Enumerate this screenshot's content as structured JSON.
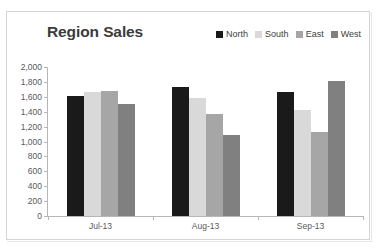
{
  "chart_data": {
    "type": "bar",
    "title": "Region Sales",
    "xlabel": "",
    "ylabel": "",
    "categories": [
      "Jul-13",
      "Aug-13",
      "Sep-13"
    ],
    "series": [
      {
        "name": "North",
        "color": "#1a1a1a",
        "values": [
          1610,
          1735,
          1660
        ]
      },
      {
        "name": "South",
        "color": "#d9d9d9",
        "values": [
          1665,
          1590,
          1420
        ]
      },
      {
        "name": "East",
        "color": "#a6a6a6",
        "values": [
          1675,
          1370,
          1130
        ]
      },
      {
        "name": "West",
        "color": "#808080",
        "values": [
          1510,
          1090,
          1810
        ]
      }
    ],
    "ylim": [
      0,
      2000
    ],
    "ytick_step": 200,
    "ytick_labels": [
      "2,000",
      "1,800",
      "1,600",
      "1,400",
      "1,200",
      "1,000",
      "800",
      "600",
      "400",
      "200",
      "0"
    ],
    "grid": false,
    "legend_position": "top-right"
  }
}
